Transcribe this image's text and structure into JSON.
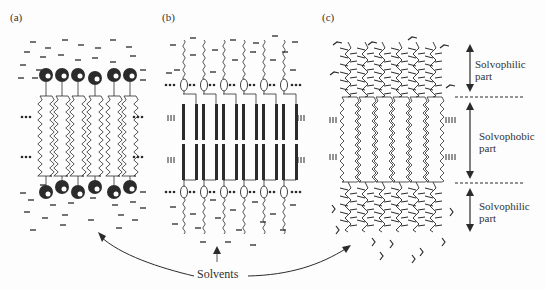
{
  "figure": {
    "panels": [
      {
        "id": "a",
        "label": "(a)",
        "x": 10,
        "y": 10
      },
      {
        "id": "b",
        "label": "(b)",
        "x": 162,
        "y": 10
      },
      {
        "id": "c",
        "label": "(c)",
        "x": 322,
        "y": 10
      }
    ],
    "annotations": {
      "solvophilic_top": {
        "line1": "Solvophilic",
        "line2": "part"
      },
      "solvophobic_mid": {
        "line1": "Solvophobic",
        "line2": "part"
      },
      "solvophilic_bottom": {
        "line1": "Solvophilic",
        "line2": "part"
      },
      "solvents": "Solvents"
    },
    "colors": {
      "ink": "#2b2b2b",
      "background": "#fdfdfd"
    },
    "panel_a": {
      "molecule_count": 6,
      "head_x": [
        46,
        62,
        78,
        95,
        114,
        130
      ],
      "head_top_y": 75,
      "head_bottom_y": 190
    },
    "panel_b": {
      "molecule_count": 6,
      "unit_x": [
        184,
        204,
        224,
        244,
        264,
        284
      ]
    },
    "panel_c": {
      "molecule_count": 6,
      "unit_x": [
        345,
        362,
        379,
        396,
        413,
        430
      ]
    }
  }
}
